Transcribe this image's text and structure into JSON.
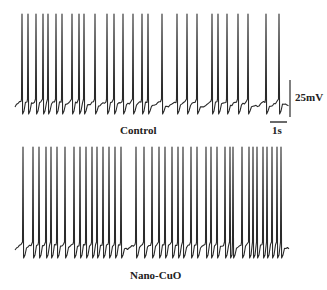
{
  "chart_data": [
    {
      "type": "line",
      "title": "Control",
      "description": "Spontaneous action potential firing trace (membrane potential vs time)",
      "baseline_y_px": 105,
      "spike_top_y_px": 14,
      "spike_trough_y_px": 114,
      "spike_times_px": [
        22,
        28,
        36,
        43,
        48,
        56,
        62,
        72,
        79,
        84,
        95,
        107,
        114,
        123,
        133,
        142,
        148,
        162,
        177,
        187,
        197,
        212,
        218,
        227,
        238,
        248,
        266,
        279
      ],
      "spike_count": 28,
      "x_range_px": [
        15,
        288
      ]
    },
    {
      "type": "line",
      "title": "Nano-CuO",
      "description": "Spontaneous action potential firing trace after Nano-CuO exposure",
      "baseline_y_px": 248,
      "spike_top_y_px": 147,
      "spike_trough_y_px": 258,
      "spike_times_px": [
        23,
        33,
        39,
        46,
        51,
        57,
        65,
        74,
        80,
        86,
        92,
        97,
        103,
        109,
        115,
        121,
        136,
        144,
        152,
        159,
        165,
        172,
        178,
        183,
        191,
        197,
        206,
        211,
        217,
        225,
        230,
        233,
        242,
        249,
        253,
        257,
        263,
        267,
        272,
        277,
        281
      ],
      "spike_count": 41,
      "x_range_px": [
        15,
        288
      ]
    }
  ],
  "scale_bar": {
    "voltage_label": "25mV",
    "time_label": "1s"
  },
  "labels": {
    "control": "Control",
    "nano": "Nano-CuO"
  },
  "colors": {
    "trace": "#2a2a2a",
    "background": "#ffffff"
  }
}
